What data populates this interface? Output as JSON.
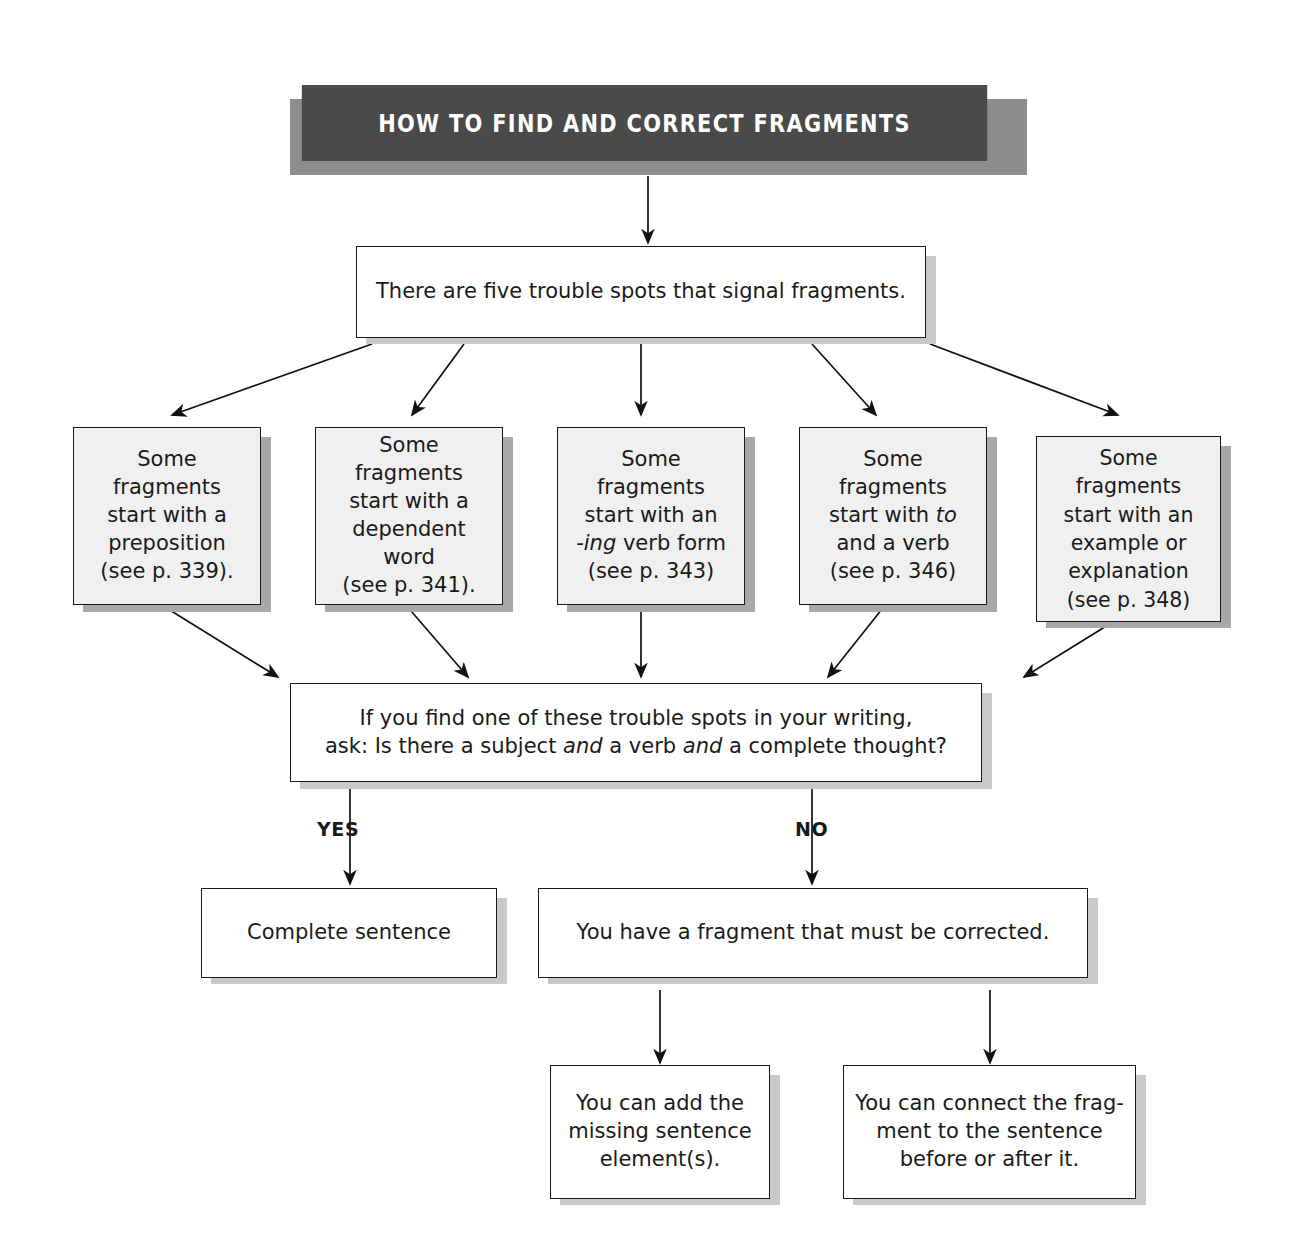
{
  "diagram": {
    "title": "HOW TO FIND AND CORRECT FRAGMENTS",
    "title_colors": {
      "background": "#4a4a4a",
      "text": "#ffffff",
      "shadow": "#8d8d8d"
    },
    "intro": "There are five trouble spots that signal fragments.",
    "trouble_spots": [
      {
        "line1": "Some fragments",
        "line2": "start with a",
        "line3": "preposition",
        "line4": "(see p. 339).",
        "line5": ""
      },
      {
        "line1": "Some fragments",
        "line2": "start with a",
        "line3": "dependent word",
        "line4": "(see p. 341).",
        "line5": ""
      },
      {
        "line1": "Some fragments",
        "line2": "start with an",
        "line3": "-ing verb form",
        "line4": "(see p. 343)",
        "line5": ""
      },
      {
        "line1": "Some fragments",
        "line2": "start with to",
        "line3": "and a verb",
        "line4": "(see p. 346)",
        "line5": ""
      },
      {
        "line1": "Some fragments",
        "line2": "start with an",
        "line3": "example or",
        "line4": "explanation",
        "line5": "(see p. 348)"
      }
    ],
    "decision": {
      "line1": "If you find one of these trouble spots in your writing,",
      "line2_part1": "ask: Is there a subject ",
      "line2_and1": "and",
      "line2_part2": " a verb ",
      "line2_and2": "and",
      "line2_part3": " a complete thought?"
    },
    "branch_yes": "YES",
    "branch_no": "NO",
    "outcome_yes": "Complete sentence",
    "outcome_no": "You have a fragment that must be corrected.",
    "fixes": [
      {
        "line1": "You can add the",
        "line2": "missing sentence",
        "line3": "element(s)."
      },
      {
        "line1": "You can connect the frag-",
        "line2": "ment to the sentence",
        "line3": "before or after it."
      }
    ]
  }
}
